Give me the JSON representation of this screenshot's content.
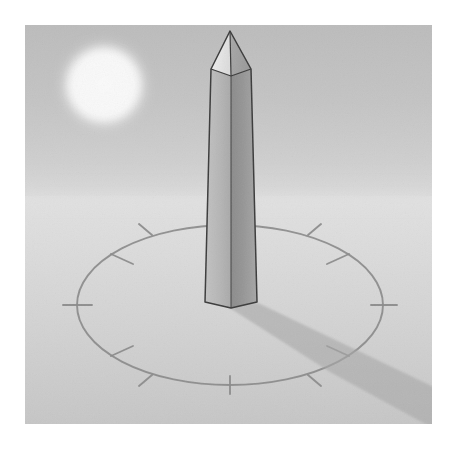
{
  "illustration": {
    "title": "Obelisk sundial",
    "subject": "obelisk-gnomon-sundial",
    "caption": "An obelisk acting as the gnomon of a sundial, casting a shadow across a tick-marked dial ellipse under a hazy sun.",
    "alt_text": "Grayscale illustration of a tall tapered obelisk with a pyramid tip standing at the centre of an elliptical dial ring marked with twelve hour ticks. A soft glowing sun sits in the upper left of the sky and the obelisk casts a long wedge-shaped shadow toward the lower right."
  },
  "canvas": {
    "width": 458,
    "height": 452,
    "background": "#ffffff",
    "margin_left": 25,
    "margin_top": 25,
    "margin_right": 26,
    "margin_bottom": 28
  },
  "scene": {
    "x": 25,
    "y": 25,
    "width": 407,
    "height": 399,
    "horizon_y": 196
  },
  "palette": {
    "paper": "#ffffff",
    "sky_top": "#bdbdbd",
    "sky_bottom": "#c9c9c9",
    "sky_haze": "#d4d4d4",
    "ground_near_horizon": "#dcdcdc",
    "ground_mid": "#d2d2d2",
    "ground_far": "#c7c7c7",
    "sun_core": "#fbfbfb",
    "sun_halo": "#e4e4e4",
    "obelisk_light_face": "#b4b4b4",
    "obelisk_dark_face": "#8e8e8e",
    "obelisk_tip_light": "#eeeeee",
    "obelisk_tip_dark": "#a3a3a3",
    "obelisk_outline": "#3c3c3c",
    "shadow": "#a8a8a8",
    "dial_line": "#8a8a8a",
    "tick_line": "#8a8a8a"
  },
  "sun": {
    "label": "Sun",
    "center_x": 104,
    "center_y": 85,
    "radius": 40,
    "glow_radius": 52,
    "core_color": "#fbfbfb",
    "halo_color": "#e4e4e4"
  },
  "sky": {
    "label": "Sky",
    "top_color": "#bdbdbd",
    "bottom_color": "#d6d6d6",
    "horizon_y": 196
  },
  "ground": {
    "label": "Ground plane",
    "near_color": "#dedede",
    "far_color": "#c8c8c8",
    "top_y": 196
  },
  "obelisk": {
    "label": "Obelisk",
    "role": "gnomon",
    "tip_x": 230,
    "tip_y": 31,
    "pyramidion_base_y": 69,
    "pyramidion_left_x": 211,
    "pyramidion_right_x": 251,
    "base_y": 302,
    "base_vertex_y": 308,
    "base_left_x": 205,
    "base_right_x": 257,
    "front_edge_top_x": 231,
    "front_edge_bottom_x": 231,
    "taper": "wider at base than at top",
    "light_face": "left",
    "shade_face": "right"
  },
  "shadow": {
    "label": "Obelisk shadow",
    "direction": "lower-right",
    "origin_x": 231,
    "origin_y": 305,
    "color": "#a8a8a8",
    "opacity": 0.55,
    "length_px": 205,
    "angle_degrees": 22
  },
  "dial": {
    "label": "Sundial dial ring",
    "center_x": 230,
    "center_y": 305,
    "radius_x": 153,
    "radius_y": 80,
    "line_color": "#8a8a8a",
    "line_width": 1.8,
    "tick_count": 12,
    "tick_length": 20,
    "tick_label": "hour-tick",
    "tick_angles_degrees": [
      0,
      30,
      60,
      90,
      120,
      150,
      180,
      210,
      240,
      270,
      300,
      330
    ]
  }
}
